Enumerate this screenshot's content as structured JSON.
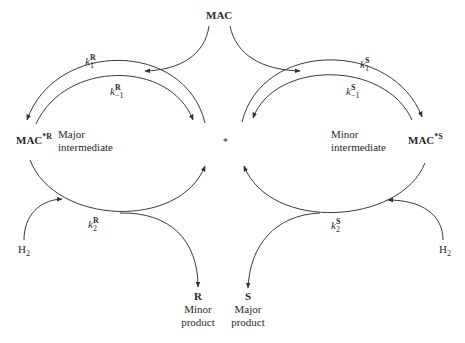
{
  "diagram": {
    "center_marker": "*",
    "nodes": {
      "mac": "MAC",
      "mac_r": {
        "base": "MAC",
        "sup": "*R",
        "description_line1": "Major",
        "description_line2": "intermediate"
      },
      "mac_s": {
        "base": "MAC",
        "sup": "*S",
        "description_line1": "Minor",
        "description_line2": "intermediate"
      },
      "h2_left": {
        "base": "H",
        "sub": "2"
      },
      "h2_right": {
        "base": "H",
        "sub": "2"
      },
      "product_r": {
        "symbol": "R",
        "line1": "Minor",
        "line2": "product"
      },
      "product_s": {
        "symbol": "S",
        "line1": "Major",
        "line2": "product"
      }
    },
    "rate_constants": {
      "k1R": {
        "k": "k",
        "sub": "1",
        "sup": "R"
      },
      "km1R": {
        "k": "k",
        "sub": "−1",
        "sup": "R"
      },
      "k1S": {
        "k": "k",
        "sub": "1",
        "sup": "S"
      },
      "km1S": {
        "k": "k",
        "sub": "−1",
        "sup": "S"
      },
      "k2R": {
        "k": "k",
        "sub": "2",
        "sup": "R"
      },
      "k2S": {
        "k": "k",
        "sub": "2",
        "sup": "S"
      }
    },
    "line_color": "#3a3a3a"
  }
}
